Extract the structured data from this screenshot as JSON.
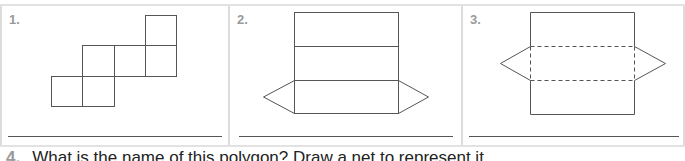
{
  "panels": [
    {
      "number": "1.",
      "figure": "cube-net-six-squares"
    },
    {
      "number": "2.",
      "figure": "triangular-prism-net"
    },
    {
      "number": "3.",
      "figure": "triangular-prism-net-dashed-folds"
    }
  ],
  "question": {
    "number": "4.",
    "text": "What is the name of this polygon? Draw a net to represent it."
  },
  "colors": {
    "line": "#555555",
    "number_gray": "#9a9a9a",
    "border": "#dcdcdc"
  }
}
